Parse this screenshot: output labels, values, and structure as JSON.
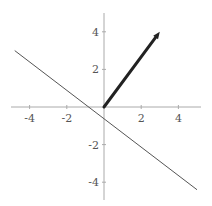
{
  "chart_data": {
    "type": "line",
    "title": "",
    "xlabel": "",
    "ylabel": "",
    "xlim": [
      -5,
      5
    ],
    "ylim": [
      -5,
      5
    ],
    "grid": false,
    "legend": null,
    "x_ticks": [
      -4,
      -2,
      2,
      4
    ],
    "y_ticks": [
      -4,
      -2,
      2,
      4
    ],
    "x_tick_labels": [
      "-4",
      "-2",
      "2",
      "4"
    ],
    "y_tick_labels": [
      "-4",
      "-2",
      "2",
      "4"
    ],
    "series": [
      {
        "name": "line",
        "kind": "line",
        "equation": "3x + 4y = -2",
        "points": [
          [
            -4.8,
            3.0
          ],
          [
            5.0,
            -4.4
          ]
        ],
        "color": "#555555",
        "width": 1
      },
      {
        "name": "vector",
        "kind": "arrow",
        "from": [
          0,
          0
        ],
        "to": [
          3,
          4
        ],
        "color": "#222222",
        "width": 3
      }
    ]
  },
  "colors": {
    "axis": "#aaaaaa",
    "line": "#555555",
    "vector": "#222222",
    "label": "#555555"
  }
}
